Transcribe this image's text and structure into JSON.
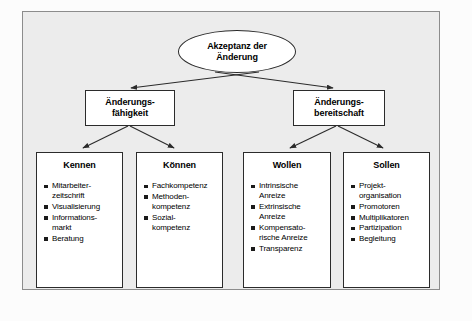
{
  "diagram": {
    "title": "Akzeptanz der Änderung",
    "root": {
      "label": "Akzeptanz der\nÄnderung",
      "line1": "Akzeptanz der",
      "line2": "Änderung",
      "shape": "ellipse"
    },
    "level2": [
      {
        "id": "aenderungsfaehigkeit",
        "line1": "Änderungs-",
        "line2": "fähigkeit"
      },
      {
        "id": "aenderungsbereitschaft",
        "line1": "Änderungs-",
        "line2": "bereitschaft"
      }
    ],
    "level3": [
      {
        "id": "kennen",
        "title": "Kennen",
        "items": [
          "Mitarbeiter-\nzeitschrift",
          "Visualisierung",
          "Informations-\nmarkt",
          "Beratung"
        ]
      },
      {
        "id": "koennen",
        "title": "Können",
        "items": [
          "Fachkompetenz",
          "Methoden-\nkompetenz",
          "Sozial-\nkompetenz"
        ]
      },
      {
        "id": "wollen",
        "title": "Wollen",
        "items": [
          "Intrinsische\nAnreize",
          "Extrinsische\nAnreize",
          "Kompensato-\nrische Anreize",
          "Transparenz"
        ]
      },
      {
        "id": "sollen",
        "title": "Sollen",
        "items": [
          "Projekt-\norganisation",
          "Promotoren",
          "Multiplikatoren",
          "Partizipation",
          "Begleitung"
        ]
      }
    ],
    "colors": {
      "frame_background": "#ececec",
      "frame_border": "#8c8c8c",
      "node_background": "#ffffff",
      "node_border": "#2b2b2b",
      "text": "#000000",
      "bullet": "#1a1a1a",
      "connector": "#2b2b2b"
    }
  }
}
